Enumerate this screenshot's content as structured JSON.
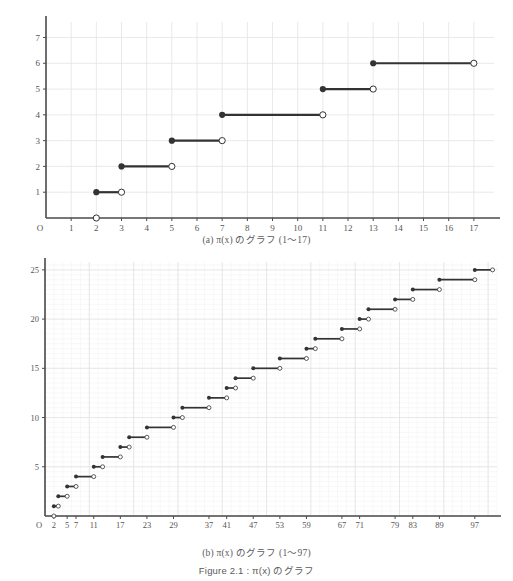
{
  "figure": {
    "title_prefix": "Figure 2.1",
    "title_sep": " : ",
    "title_func": "π(x)",
    "title_suffix": " のグラフ",
    "title_full": "Figure 2.1 : π(x) のグラフ"
  },
  "panel_a": {
    "caption_label": "(a)",
    "caption_func": "π(x)",
    "caption_text": " のグラフ  (1～17)",
    "caption_full": "(a)  π(x) のグラフ  (1～17)",
    "origin_label": "O"
  },
  "panel_b": {
    "caption_label": "(b)",
    "caption_func": "π(x)",
    "caption_text": " のグラフ  (1～97)",
    "caption_full": "(b)  π(x) のグラフ  (1～97)",
    "origin_label": "O"
  },
  "colors": {
    "ink": "#333333",
    "grid": "#e3e3e6",
    "grid_minor": "#f0f0f2",
    "axis": "#4a4a4a",
    "label": "#555555",
    "background": "#ffffff"
  },
  "chart_data": [
    {
      "type": "line",
      "id": "pi-x-1-17",
      "title": "(a)  π(x) のグラフ  (1～17)",
      "xlabel": "",
      "ylabel": "",
      "xlim": [
        0,
        17.8
      ],
      "ylim": [
        0,
        7.6
      ],
      "grid": true,
      "legend": "none",
      "x_ticks": [
        1,
        2,
        3,
        4,
        5,
        6,
        7,
        8,
        9,
        10,
        11,
        12,
        13,
        14,
        15,
        16,
        17
      ],
      "x_tick_labels": [
        "1",
        "2",
        "3",
        "4",
        "5",
        "6",
        "7",
        "8",
        "9",
        "10",
        "11",
        "12",
        "13",
        "14",
        "15",
        "16",
        "17"
      ],
      "y_ticks": [
        1,
        2,
        3,
        4,
        5,
        6,
        7
      ],
      "y_tick_labels": [
        "1",
        "2",
        "3",
        "4",
        "5",
        "6",
        "7"
      ],
      "origin_label": "O",
      "description": "Step function π(x), prime counting function, drawn as right-open step segments with filled left endpoint and open right endpoint.",
      "steps": [
        {
          "x_start": 0,
          "x_end": 2,
          "y": 0,
          "left_closed": false,
          "right_open": true,
          "drawn": false
        },
        {
          "x_start": 2,
          "x_end": 3,
          "y": 1,
          "left_closed": true,
          "right_open": true
        },
        {
          "x_start": 3,
          "x_end": 5,
          "y": 2,
          "left_closed": true,
          "right_open": true
        },
        {
          "x_start": 5,
          "x_end": 7,
          "y": 3,
          "left_closed": true,
          "right_open": true
        },
        {
          "x_start": 7,
          "x_end": 11,
          "y": 4,
          "left_closed": true,
          "right_open": true
        },
        {
          "x_start": 11,
          "x_end": 13,
          "y": 5,
          "left_closed": true,
          "right_open": true
        },
        {
          "x_start": 13,
          "x_end": 17,
          "y": 6,
          "left_closed": true,
          "right_open": true
        }
      ],
      "open_origin_marker": {
        "x": 2,
        "y": 0
      }
    },
    {
      "type": "line",
      "id": "pi-x-1-97",
      "title": "(b)  π(x) のグラフ  (1～97)",
      "xlabel": "",
      "ylabel": "",
      "xlim": [
        0,
        102
      ],
      "ylim": [
        0,
        25.8
      ],
      "grid": true,
      "legend": "none",
      "x_ticks": [
        2,
        5,
        7,
        11,
        17,
        23,
        29,
        37,
        41,
        47,
        53,
        59,
        67,
        71,
        79,
        83,
        89,
        97
      ],
      "x_tick_labels": [
        "2",
        "5",
        "7",
        "11",
        "17",
        "23",
        "29",
        "37",
        "41",
        "47",
        "53",
        "59",
        "67",
        "71",
        "79",
        "83",
        "89",
        "97"
      ],
      "y_ticks": [
        5,
        10,
        15,
        20,
        25
      ],
      "y_tick_labels": [
        "5",
        "10",
        "15",
        "20",
        "25"
      ],
      "origin_label": "O",
      "description": "Step function π(x) for 1 to 97; each step begins at a prime p with value π(p) and runs to the next prime.",
      "primes": [
        2,
        3,
        5,
        7,
        11,
        13,
        17,
        19,
        23,
        29,
        31,
        37,
        41,
        43,
        47,
        53,
        59,
        61,
        67,
        71,
        73,
        79,
        83,
        89,
        97
      ],
      "steps": [
        {
          "x_start": 2,
          "x_end": 3,
          "y": 1
        },
        {
          "x_start": 3,
          "x_end": 5,
          "y": 2
        },
        {
          "x_start": 5,
          "x_end": 7,
          "y": 3
        },
        {
          "x_start": 7,
          "x_end": 11,
          "y": 4
        },
        {
          "x_start": 11,
          "x_end": 13,
          "y": 5
        },
        {
          "x_start": 13,
          "x_end": 17,
          "y": 6
        },
        {
          "x_start": 17,
          "x_end": 19,
          "y": 7
        },
        {
          "x_start": 19,
          "x_end": 23,
          "y": 8
        },
        {
          "x_start": 23,
          "x_end": 29,
          "y": 9
        },
        {
          "x_start": 29,
          "x_end": 31,
          "y": 10
        },
        {
          "x_start": 31,
          "x_end": 37,
          "y": 11
        },
        {
          "x_start": 37,
          "x_end": 41,
          "y": 12
        },
        {
          "x_start": 41,
          "x_end": 43,
          "y": 13
        },
        {
          "x_start": 43,
          "x_end": 47,
          "y": 14
        },
        {
          "x_start": 47,
          "x_end": 53,
          "y": 15
        },
        {
          "x_start": 53,
          "x_end": 59,
          "y": 16
        },
        {
          "x_start": 59,
          "x_end": 61,
          "y": 17
        },
        {
          "x_start": 61,
          "x_end": 67,
          "y": 18
        },
        {
          "x_start": 67,
          "x_end": 71,
          "y": 19
        },
        {
          "x_start": 71,
          "x_end": 73,
          "y": 20
        },
        {
          "x_start": 73,
          "x_end": 79,
          "y": 21
        },
        {
          "x_start": 79,
          "x_end": 83,
          "y": 22
        },
        {
          "x_start": 83,
          "x_end": 89,
          "y": 23
        },
        {
          "x_start": 89,
          "x_end": 97,
          "y": 24
        },
        {
          "x_start": 97,
          "x_end": 101,
          "y": 25
        }
      ],
      "open_origin_marker": {
        "x": 2,
        "y": 0
      }
    }
  ]
}
